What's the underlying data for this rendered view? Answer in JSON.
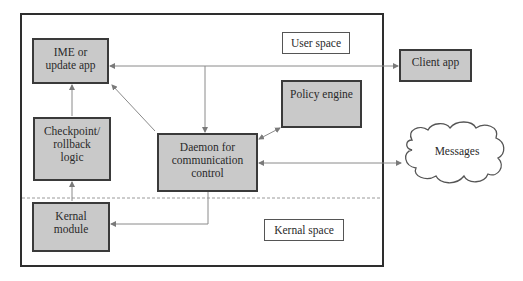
{
  "diagram": {
    "regions": {
      "user_space": "User space",
      "kernal_space": "Kernal space"
    },
    "nodes": {
      "ime": "IME or update app",
      "ime_lines": [
        "IME or",
        "update app"
      ],
      "checkpoint": "Checkpoint/ rollback logic",
      "checkpoint_lines": [
        "Checkpoint/",
        "rollback",
        "logic"
      ],
      "kernal_module": "Kernal module",
      "kernal_module_lines": [
        "Kernal",
        "module"
      ],
      "daemon": "Daemon for communication control",
      "daemon_lines": [
        "Daemon for",
        "communication",
        "control"
      ],
      "policy_engine": "Policy engine",
      "client_app": "Client app",
      "messages": "Messages"
    },
    "edges": [
      {
        "from": "checkpoint",
        "to": "ime",
        "direction": "one-way"
      },
      {
        "from": "kernal_module",
        "to": "checkpoint",
        "direction": "one-way"
      },
      {
        "from": "daemon",
        "to": "ime",
        "direction": "one-way"
      },
      {
        "from": "ime",
        "to": "client_app",
        "direction": "two-way"
      },
      {
        "from": "ime_client_link",
        "to": "daemon",
        "direction": "one-way"
      },
      {
        "from": "daemon",
        "to": "policy_engine",
        "direction": "two-way"
      },
      {
        "from": "daemon",
        "to": "messages",
        "direction": "two-way"
      },
      {
        "from": "daemon",
        "to": "kernal_module",
        "direction": "one-way"
      }
    ],
    "colors": {
      "box_fill": "#c9c9c9",
      "box_border": "#3a3a3a",
      "arrow": "#8a8a8a",
      "divider": "#999999"
    }
  }
}
